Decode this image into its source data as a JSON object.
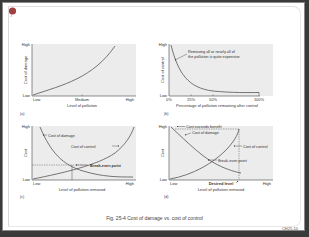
{
  "caption": "Fig. 25-4 Cost of damage vs. cost of control",
  "slide_code": "CH25-10",
  "colors": {
    "plot_bg": "#ececec",
    "curve": "#555555",
    "axis": "#444444"
  },
  "panels": [
    {
      "id": "a",
      "label": "(a)",
      "ylabel": "Cost of damage",
      "xlabel": "Level of pollution",
      "y_ticks": [
        "Low",
        "High"
      ],
      "x_ticks": [
        "Low",
        "Medium",
        "High"
      ],
      "curves": [
        {
          "name": "Cost of damage",
          "shape": "increasing-convex"
        }
      ]
    },
    {
      "id": "b",
      "label": "(b)",
      "ylabel": "Cost of control",
      "xlabel": "Percentage of pollution remaining after control",
      "y_ticks": [
        "Low",
        "High"
      ],
      "x_ticks": [
        "0%",
        "25%",
        "50%",
        "100%"
      ],
      "annotation": "Removing all or nearly all of the pollution is quite expensive",
      "annotation_lines": [
        "Removing all or nearly all of",
        "the pollution is quite expensive"
      ],
      "curves": [
        {
          "name": "Cost of control",
          "shape": "decreasing-convex"
        }
      ]
    },
    {
      "id": "c",
      "label": "(c)",
      "ylabel": "Cost",
      "xlabel": "Level of pollution removed",
      "y_ticks": [
        "Low",
        "High"
      ],
      "x_ticks": [
        "Low",
        "High"
      ],
      "labels": {
        "damage": "Cost of damage",
        "control": "Cost of control",
        "breakeven": "Break-even point"
      },
      "curves": [
        {
          "name": "Cost of damage",
          "shape": "decreasing-convex"
        },
        {
          "name": "Cost of control",
          "shape": "increasing-convex"
        }
      ]
    },
    {
      "id": "d",
      "label": "(d)",
      "ylabel": "Cost",
      "xlabel": "Level of pollution removed",
      "y_ticks": [
        "Low",
        "High"
      ],
      "x_ticks": [
        "Low",
        "High"
      ],
      "desired_level": "Desired level",
      "labels": {
        "exceeds": "Cost exceeds benefit",
        "damage": "Cost of damage",
        "control": "Cost of control",
        "breakeven": "Break-even point"
      },
      "curves": [
        {
          "name": "Cost of damage",
          "shape": "decreasing"
        },
        {
          "name": "Cost of control",
          "shape": "increasing-convex"
        }
      ]
    }
  ]
}
